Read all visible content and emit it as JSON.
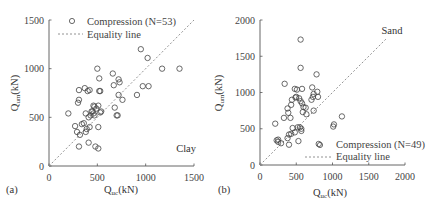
{
  "chart_data": [
    {
      "type": "scatter",
      "panel_label": "(a)",
      "annotation": "Clay",
      "xlabel": "Q_uc(kN)",
      "ylabel": "Q_um(kN)",
      "xlim": [
        0,
        1500
      ],
      "ylim": [
        0,
        1500
      ],
      "xticks": [
        "0",
        "500",
        "1000",
        "1500"
      ],
      "yticks": [
        "0",
        "500",
        "1000",
        "1500"
      ],
      "legend": [
        {
          "label": "Compression (N=53)",
          "marker": "circle"
        },
        {
          "label": "Equality line",
          "style": "dashed"
        }
      ],
      "legend_position": "upper left",
      "series": [
        {
          "name": "Compression (N=53)",
          "points": [
            [
              200,
              540
            ],
            [
              270,
              410
            ],
            [
              290,
              350
            ],
            [
              300,
              650
            ],
            [
              310,
              780
            ],
            [
              310,
              680
            ],
            [
              320,
              320
            ],
            [
              310,
              200
            ],
            [
              340,
              430
            ],
            [
              360,
              440
            ],
            [
              370,
              800
            ],
            [
              380,
              350
            ],
            [
              380,
              540
            ],
            [
              390,
              380
            ],
            [
              400,
              770
            ],
            [
              410,
              240
            ],
            [
              410,
              500
            ],
            [
              420,
              780
            ],
            [
              420,
              400
            ],
            [
              430,
              520
            ],
            [
              440,
              560
            ],
            [
              450,
              560
            ],
            [
              460,
              620
            ],
            [
              460,
              540
            ],
            [
              470,
              610
            ],
            [
              470,
              520
            ],
            [
              480,
              200
            ],
            [
              490,
              590
            ],
            [
              500,
              1000
            ],
            [
              510,
              180
            ],
            [
              510,
              620
            ],
            [
              510,
              400
            ],
            [
              520,
              900
            ],
            [
              520,
              770
            ],
            [
              530,
              770
            ],
            [
              530,
              550
            ],
            [
              540,
              560
            ],
            [
              660,
              950
            ],
            [
              670,
              830
            ],
            [
              680,
              600
            ],
            [
              700,
              520
            ],
            [
              710,
              520
            ],
            [
              720,
              890
            ],
            [
              720,
              730
            ],
            [
              730,
              860
            ],
            [
              760,
              680
            ],
            [
              910,
              730
            ],
            [
              950,
              1200
            ],
            [
              970,
              820
            ],
            [
              1020,
              1110
            ],
            [
              1030,
              820
            ],
            [
              1170,
              1000
            ],
            [
              1350,
              1000
            ]
          ]
        },
        {
          "name": "Equality line",
          "points": [
            [
              0,
              0
            ],
            [
              1500,
              1500
            ]
          ]
        }
      ]
    },
    {
      "type": "scatter",
      "panel_label": "(b)",
      "annotation": "Sand",
      "xlabel": "Q_uc(kN)",
      "ylabel": "Q_um(kN)",
      "xlim": [
        0,
        2000
      ],
      "ylim": [
        0,
        2000
      ],
      "xticks": [
        "0",
        "500",
        "1000",
        "1500",
        "2000"
      ],
      "yticks": [
        "0",
        "500",
        "1000",
        "1500",
        "2000"
      ],
      "legend": [
        {
          "label": "Compression (N=49)",
          "marker": "circle"
        },
        {
          "label": "Equality line",
          "style": "dashed"
        }
      ],
      "legend_position": "lower right",
      "series": [
        {
          "name": "Compression (N=49)",
          "points": [
            [
              210,
              570
            ],
            [
              230,
              340
            ],
            [
              250,
              320
            ],
            [
              290,
              300
            ],
            [
              330,
              650
            ],
            [
              340,
              1120
            ],
            [
              380,
              780
            ],
            [
              390,
              720
            ],
            [
              400,
              420
            ],
            [
              400,
              280
            ],
            [
              420,
              650
            ],
            [
              430,
              830
            ],
            [
              440,
              900
            ],
            [
              450,
              510
            ],
            [
              480,
              1050
            ],
            [
              480,
              450
            ],
            [
              490,
              930
            ],
            [
              500,
              940
            ],
            [
              510,
              1040
            ],
            [
              520,
              520
            ],
            [
              530,
              330
            ],
            [
              540,
              920
            ],
            [
              550,
              520
            ],
            [
              560,
              1730
            ],
            [
              560,
              1340
            ],
            [
              570,
              500
            ],
            [
              570,
              470
            ],
            [
              580,
              850
            ],
            [
              580,
              1050
            ],
            [
              590,
              730
            ],
            [
              600,
              800
            ],
            [
              630,
              790
            ],
            [
              640,
              700
            ],
            [
              710,
              900
            ],
            [
              720,
              1070
            ],
            [
              730,
              940
            ],
            [
              740,
              980
            ],
            [
              740,
              750
            ],
            [
              780,
              1250
            ],
            [
              790,
              1010
            ],
            [
              800,
              940
            ],
            [
              810,
              290
            ],
            [
              1010,
              530
            ],
            [
              1020,
              560
            ],
            [
              1130,
              670
            ],
            [
              560,
              880
            ],
            [
              430,
              430
            ],
            [
              380,
              370
            ],
            [
              250,
              350
            ]
          ]
        },
        {
          "name": "Equality line",
          "points": [
            [
              0,
              0
            ],
            [
              1750,
              1750
            ]
          ]
        }
      ]
    }
  ],
  "panels": {
    "a": {
      "label": "(a)",
      "annotation": "Clay",
      "legend_marker": "Compression (N=53)",
      "legend_line": "Equality line",
      "x_main": "Q",
      "x_sub": "uc",
      "x_unit": "(kN)",
      "y_main": "Q",
      "y_sub": "um",
      "y_unit": "(kN)"
    },
    "b": {
      "label": "(b)",
      "annotation": "Sand",
      "legend_marker": "Compression (N=49)",
      "legend_line": "Equality line",
      "x_main": "Q",
      "x_sub": "uc",
      "x_unit": "(kN)",
      "y_main": "Q",
      "y_sub": "um",
      "y_unit": "(kN)"
    }
  }
}
